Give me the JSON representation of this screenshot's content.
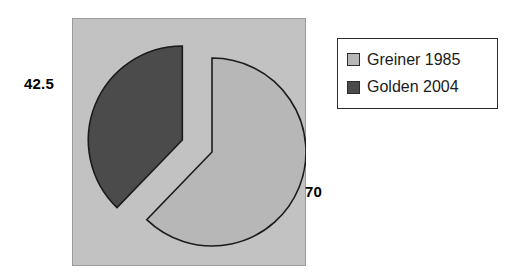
{
  "chart_data": {
    "type": "pie",
    "title": "",
    "categories": [
      "Greiner 1985",
      "Golden 2004"
    ],
    "values": [
      70,
      42.5
    ],
    "value_labels": [
      "70",
      "42.5"
    ],
    "percentages": [
      62.2,
      37.8
    ],
    "colors": [
      "#b7b7b7",
      "#4b4b4b"
    ],
    "exploded": [
      false,
      true
    ],
    "legend_position": "right",
    "plot_background": "#c2c2c2",
    "outline_color": "#1b1b1b",
    "start_angle_deg": 0,
    "xlabel": "",
    "ylabel": ""
  },
  "legend": {
    "items": [
      {
        "label": "Greiner 1985",
        "swatch_color": "#b7b7b7",
        "swatch_name": "legend-swatch-greiner"
      },
      {
        "label": "Golden 2004",
        "swatch_color": "#4b4b4b",
        "swatch_name": "legend-swatch-golden"
      }
    ]
  },
  "labels": {
    "golden_value": "42.5",
    "greiner_value": "70"
  }
}
